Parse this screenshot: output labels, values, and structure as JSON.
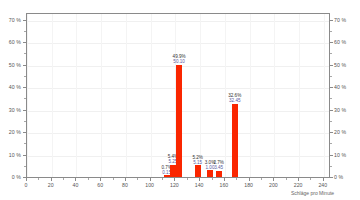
{
  "chart_data": {
    "type": "bar",
    "title": "",
    "subtitle": "",
    "xlabel": "Schläge pro Minute",
    "ylabel": "",
    "xlim": [
      0,
      245
    ],
    "ylim": [
      0,
      73
    ],
    "grid": true,
    "legend": null,
    "y_tick_labels": [
      "0 %",
      "10 %",
      "20 %",
      "30 %",
      "40 %",
      "50 %",
      "60 %",
      "70 %"
    ],
    "y_tick_values": [
      0,
      10,
      20,
      30,
      40,
      50,
      60,
      70
    ],
    "y_axis_right_tick_labels": [
      "0 %",
      "10 %",
      "20 %",
      "30 %",
      "40 %",
      "50 %",
      "60 %",
      "70 %"
    ],
    "x_tick_labels": [
      "0",
      "20",
      "40",
      "60",
      "80",
      "100",
      "120",
      "140",
      "160",
      "180",
      "200",
      "220",
      "240"
    ],
    "x_tick_values": [
      0,
      20,
      40,
      60,
      80,
      100,
      120,
      140,
      160,
      180,
      200,
      220,
      240
    ],
    "bar_color": "#fa2600",
    "bin_width": 5,
    "bars": [
      {
        "x": 113,
        "percent": 0.7,
        "percent_label": "0.7%",
        "value_label": "0.15"
      },
      {
        "x": 118,
        "percent": 5.4,
        "percent_label": "5.4%",
        "value_label": "5.25"
      },
      {
        "x": 123,
        "percent": 49.9,
        "percent_label": "49.9%",
        "value_label": "50.10"
      },
      {
        "x": 138,
        "percent": 5.2,
        "percent_label": "5.2%",
        "value_label": "5.15"
      },
      {
        "x": 148,
        "percent": 3.0,
        "percent_label": "3.0%",
        "value_label": "1.00"
      },
      {
        "x": 155,
        "percent": 2.7,
        "percent_label": "2.7%",
        "value_label": "3.45"
      },
      {
        "x": 168,
        "percent": 32.6,
        "percent_label": "32.6%",
        "value_label": "32.45"
      }
    ],
    "categories": [
      113,
      118,
      123,
      138,
      148,
      155,
      168
    ],
    "values": [
      0.7,
      5.4,
      49.9,
      5.2,
      3.0,
      2.7,
      32.6
    ]
  }
}
